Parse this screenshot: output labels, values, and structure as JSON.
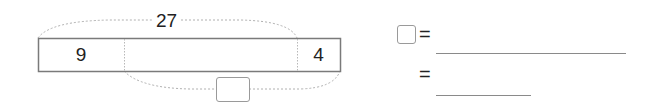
{
  "tape_diagram": {
    "total_label": "27",
    "segments": [
      {
        "label": "9"
      },
      {
        "label": ""
      },
      {
        "label": "4"
      }
    ],
    "unknown_box": ""
  },
  "equations": {
    "row1": {
      "box": "",
      "equals": "=",
      "answer": ""
    },
    "row2": {
      "equals": "=",
      "answer": ""
    }
  },
  "colors": {
    "border": "#7a7a7a",
    "dotted": "#b0b0b0",
    "text": "#222222"
  }
}
